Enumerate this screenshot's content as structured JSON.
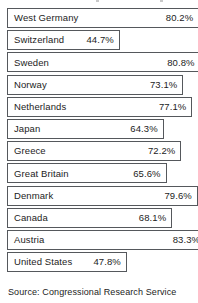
{
  "source_note": "Source: Congressional Research Service",
  "chart_data": {
    "type": "bar",
    "orientation": "horizontal",
    "title": "",
    "subtitle": "",
    "xlabel": "",
    "ylabel": "",
    "xlim": [
      0,
      90
    ],
    "grid": false,
    "legend": null,
    "value_suffix": "%",
    "value_labels_inside": true,
    "categories": [
      "West Germany",
      "Switzerland",
      "Sweden",
      "Norway",
      "Netherlands",
      "Japan",
      "Greece",
      "Great Britain",
      "Denmark",
      "Canada",
      "Austria",
      "United States"
    ],
    "values": [
      80.2,
      44.7,
      80.8,
      73.1,
      77.1,
      64.3,
      72.2,
      65.6,
      79.6,
      68.1,
      83.3,
      47.8
    ],
    "value_text": [
      "80.2%",
      "44.7%",
      "80.8%",
      "73.1%",
      "77.1%",
      "64.3%",
      "72.2%",
      "65.6%",
      "79.6%",
      "68.1%",
      "83.3%",
      "47.8%"
    ],
    "bars": [
      {
        "label": "West Germany",
        "value": 80.2,
        "value_text": "80.2%"
      },
      {
        "label": "Switzerland",
        "value": 44.7,
        "value_text": "44.7%"
      },
      {
        "label": "Sweden",
        "value": 80.8,
        "value_text": "80.8%"
      },
      {
        "label": "Norway",
        "value": 73.1,
        "value_text": "73.1%"
      },
      {
        "label": "Netherlands",
        "value": 77.1,
        "value_text": "77.1%"
      },
      {
        "label": "Japan",
        "value": 64.3,
        "value_text": "64.3%"
      },
      {
        "label": "Greece",
        "value": 72.2,
        "value_text": "72.2%"
      },
      {
        "label": "Great Britain",
        "value": 65.6,
        "value_text": "65.6%"
      },
      {
        "label": "Denmark",
        "value": 79.6,
        "value_text": "79.6%"
      },
      {
        "label": "Canada",
        "value": 68.1,
        "value_text": "68.1%"
      },
      {
        "label": "Austria",
        "value": 83.3,
        "value_text": "83.3%"
      },
      {
        "label": "United States",
        "value": 47.8,
        "value_text": "47.8%"
      }
    ]
  },
  "style": {
    "bar_fill": "#ffffff",
    "bar_border": "#55585c",
    "text_color": "#1c1c1c",
    "background": "#ffffff"
  },
  "layout": {
    "bar_left_px": 7,
    "bar_height_px": 20,
    "row_pitch_px": 22.2,
    "px_per_unit": 2.235,
    "base_offset_px": 13
  }
}
